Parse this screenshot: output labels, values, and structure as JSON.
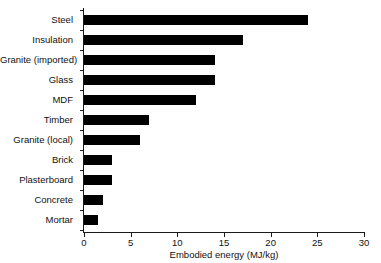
{
  "chart_data": {
    "type": "bar",
    "orientation": "horizontal",
    "title": "",
    "xlabel": "Embodied energy (MJ/kg)",
    "ylabel": "",
    "xlim": [
      0,
      30
    ],
    "xticks": [
      0,
      5,
      10,
      15,
      20,
      25,
      30
    ],
    "xtick_labels": [
      "0",
      "5",
      "10",
      "15",
      "20",
      "25",
      "30"
    ],
    "grid": false,
    "legend": null,
    "bar_color": "#000000",
    "axis_color": "#1a1a1a",
    "categories": [
      "Steel",
      "Insulation",
      "Granite (imported)",
      "Glass",
      "MDF",
      "Timber",
      "Granite (local)",
      "Brick",
      "Plasterboard",
      "Concrete",
      "Mortar"
    ],
    "values": [
      24,
      17,
      14,
      14,
      12,
      7,
      6,
      3,
      3,
      2,
      1.5
    ]
  }
}
